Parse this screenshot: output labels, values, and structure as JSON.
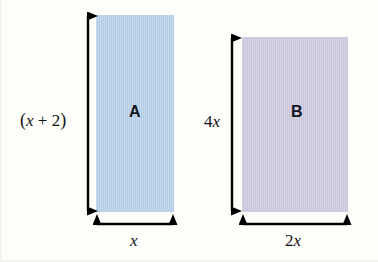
{
  "figure": {
    "type": "geometry-diagram",
    "background_color": "#fdfdfa"
  },
  "shapes": [
    {
      "id": "rect-a",
      "label": "A",
      "fill_color": "#b6cfe8",
      "x": 96,
      "y": 15,
      "width": 78,
      "height": 197,
      "height_label": {
        "parts": [
          "(",
          "x",
          " + ",
          "2",
          ")"
        ],
        "text": "(x + 2)"
      },
      "width_label": {
        "text": "x"
      }
    },
    {
      "id": "rect-b",
      "label": "B",
      "fill_color": "#cdc7dd",
      "x": 242,
      "y": 37,
      "width": 106,
      "height": 175,
      "height_label": {
        "coefficient": "4",
        "variable": "x",
        "text": "4x"
      },
      "width_label": {
        "coefficient": "2",
        "variable": "x",
        "text": "2x"
      }
    }
  ],
  "dimension_lines": {
    "stroke_color": "#000000"
  }
}
